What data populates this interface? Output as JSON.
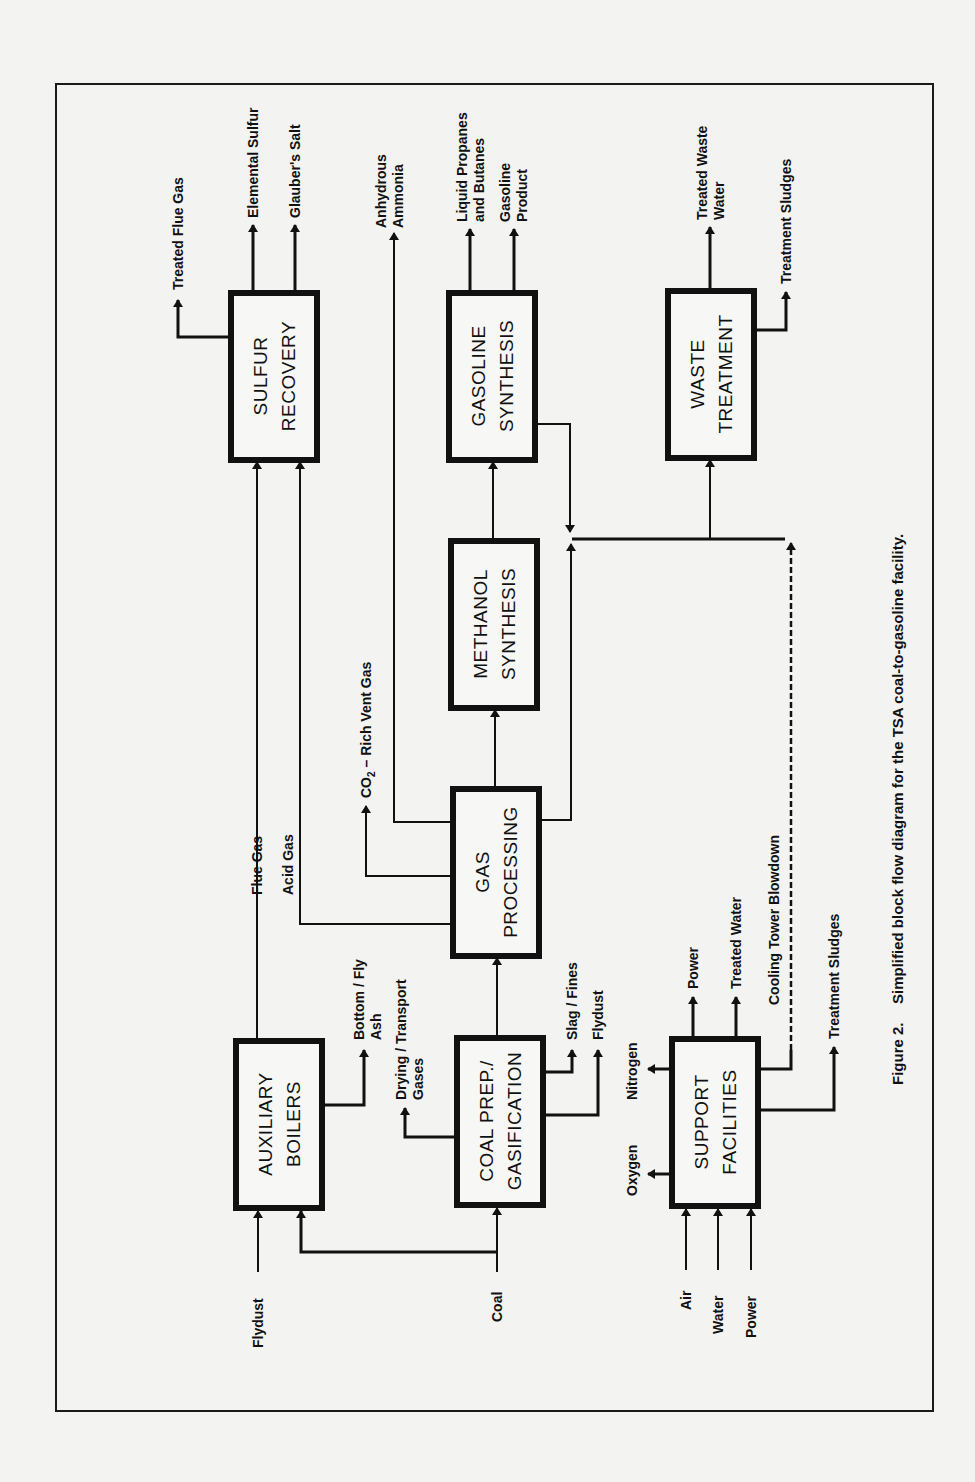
{
  "figure": {
    "caption_number": "Figure 2.",
    "caption_text": "Simplified block flow diagram for the TSA coal-to-gasoline facility."
  },
  "blocks": {
    "sulfur_recovery": [
      "SULFUR",
      "RECOVERY"
    ],
    "gasoline_synthesis": [
      "GASOLINE",
      "SYNTHESIS"
    ],
    "waste_treatment": [
      "WASTE",
      "TREATMENT"
    ],
    "methanol_synthesis": [
      "METHANOL",
      "SYNTHESIS"
    ],
    "gas_processing": [
      "GAS",
      "PROCESSING"
    ],
    "auxiliary_boilers": [
      "AUXILIARY",
      "BOILERS"
    ],
    "coal_prep_gasification": [
      "COAL PREP./",
      "GASIFICATION"
    ],
    "support_facilities": [
      "SUPPORT",
      "FACILITIES"
    ]
  },
  "streams": {
    "treated_flue_gas": "Treated Flue Gas",
    "elemental_sulfur": "Elemental Sulfur",
    "glaubers_salt": "Glauber's Salt",
    "anhydrous_ammonia": [
      "Anhydrous",
      "Ammonia"
    ],
    "liquid_propanes_butanes": [
      "Liquid Propanes",
      "and Butanes"
    ],
    "gasoline_product": [
      "Gasoline",
      "Product"
    ],
    "treated_waste_water": [
      "Treated Waste",
      "Water"
    ],
    "treatment_sludges_top": "Treatment Sludges",
    "co2_rich_vent_gas_prefix": "CO",
    "co2_rich_vent_gas_sub": "2",
    "co2_rich_vent_gas_suffix": " – Rich Vent Gas",
    "flue_gas": "Flue Gas",
    "acid_gas": "Acid Gas",
    "bottom_fly_ash": [
      "Bottom / Fly",
      "Ash"
    ],
    "drying_transport_gases": [
      "Drying / Transport",
      "Gases"
    ],
    "slag_fines": "Slag / Fines",
    "flydust_out": "Flydust",
    "nitrogen": "Nitrogen",
    "oxygen": "Oxygen",
    "power_out": "Power",
    "treated_water": "Treated Water",
    "cooling_tower_blowdown": "Cooling Tower Blowdown",
    "treatment_sludges_bottom": "Treatment Sludges",
    "flydust_in": "Flydust",
    "coal": "Coal",
    "air": "Air",
    "water": "Water",
    "power_in": "Power"
  }
}
